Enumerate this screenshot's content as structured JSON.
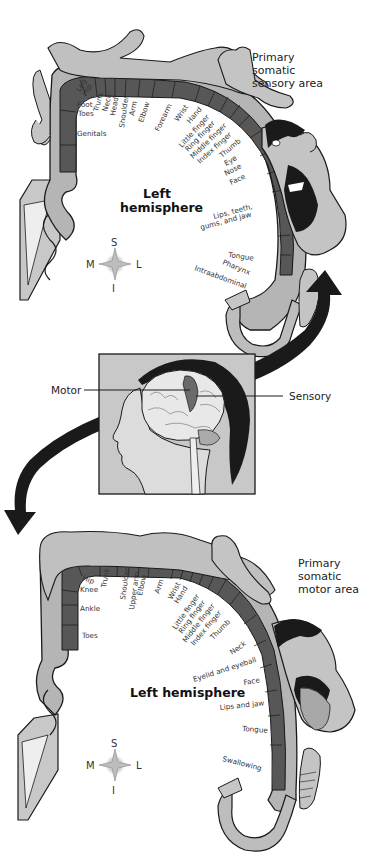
{
  "sensory": {
    "title_lines": [
      "Primary",
      "somatic",
      "sensory area"
    ],
    "hemisphere_lines": [
      "Left",
      "hemisphere"
    ],
    "labels": [
      "Leg",
      "Hip",
      "Foot",
      "Trunk",
      "Neck",
      "Head",
      "Shoulder",
      "Arm",
      "Elbow",
      "Forearm",
      "Wrist",
      "Hand",
      "Little finger",
      "Ring finger",
      "Middle finger",
      "Index finger",
      "Thumb",
      "Eye",
      "Nose",
      "Face",
      "Toes",
      "Genitals",
      "Lips, teeth,",
      "gums, and jaw",
      "Tongue",
      "Pharynx",
      "Intraabdominal"
    ]
  },
  "center": {
    "motor_label": "Motor",
    "sensory_label": "Sensory"
  },
  "motor": {
    "title_lines": [
      "Primary",
      "somatic",
      "motor area"
    ],
    "hemisphere": "Left hemisphere",
    "labels": [
      "Hip",
      "Trunk",
      "Knee",
      "Ankle",
      "Toes",
      "Shoulder",
      "Upper arm",
      "Elbow",
      "Arm",
      "Wrist",
      "Hand",
      "Little finger",
      "Ring finger",
      "Middle finger",
      "Index finger",
      "Thumb",
      "Neck",
      "Eyelid and eyeball",
      "Face",
      "Lips and jaw",
      "Tongue",
      "Swallowing"
    ]
  },
  "compass": {
    "top": "S",
    "bottom": "I",
    "left": "M",
    "right": "L"
  },
  "colors": {
    "band": "#555555",
    "body": "#b5b5b5",
    "outline": "#1a1a1a",
    "arrow": "#1a1a1a",
    "box": "#c8c8c8"
  }
}
